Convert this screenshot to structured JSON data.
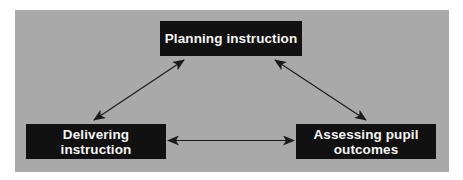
{
  "diagram": {
    "type": "cycle-triangle",
    "colors": {
      "background": "#ffffff",
      "panel": "#a9a9a9",
      "node_fill": "#111111",
      "node_text": "#f4f4f4",
      "arrow": "#1a1a1a"
    },
    "nodes": [
      {
        "id": "planning",
        "label": "Planning instruction"
      },
      {
        "id": "delivering",
        "label": "Delivering instruction"
      },
      {
        "id": "assessing",
        "label": "Assessing pupil\noutcomes"
      }
    ],
    "edges": [
      {
        "from": "planning",
        "to": "delivering",
        "direction": "both"
      },
      {
        "from": "planning",
        "to": "assessing",
        "direction": "both"
      },
      {
        "from": "delivering",
        "to": "assessing",
        "direction": "both"
      }
    ]
  }
}
